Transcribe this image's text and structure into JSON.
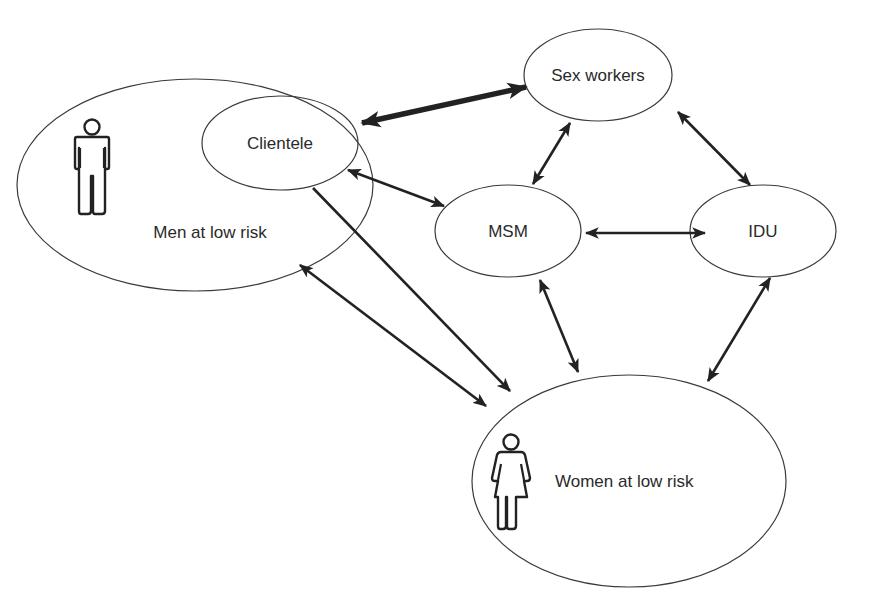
{
  "diagram": {
    "type": "network",
    "nodes": [
      {
        "id": "men",
        "label": "Men at low risk",
        "icon": "male-person-icon"
      },
      {
        "id": "clientele",
        "label": "Clientele",
        "parent": "men"
      },
      {
        "id": "sexworkers",
        "label": "Sex workers"
      },
      {
        "id": "msm",
        "label": "MSM"
      },
      {
        "id": "idu",
        "label": "IDU"
      },
      {
        "id": "women",
        "label": "Women at low risk",
        "icon": "female-person-icon"
      }
    ],
    "edges": [
      {
        "from": "clientele",
        "to": "sexworkers",
        "direction": "both",
        "weight": "thick"
      },
      {
        "from": "clientele",
        "to": "msm",
        "direction": "both",
        "weight": "normal"
      },
      {
        "from": "sexworkers",
        "to": "msm",
        "direction": "both",
        "weight": "normal"
      },
      {
        "from": "sexworkers",
        "to": "idu",
        "direction": "both",
        "weight": "normal"
      },
      {
        "from": "msm",
        "to": "idu",
        "direction": "both",
        "weight": "normal"
      },
      {
        "from": "msm",
        "to": "women",
        "direction": "both",
        "weight": "normal"
      },
      {
        "from": "idu",
        "to": "women",
        "direction": "both",
        "weight": "normal"
      },
      {
        "from": "clientele",
        "to": "women",
        "direction": "forward",
        "weight": "normal"
      },
      {
        "from": "men",
        "to": "women",
        "direction": "both",
        "weight": "normal"
      }
    ]
  },
  "labels": {
    "men": "Men at low risk",
    "clientele": "Clientele",
    "sexworkers": "Sex workers",
    "msm": "MSM",
    "idu": "IDU",
    "women": "Women at low risk"
  },
  "colors": {
    "stroke": "#222222",
    "background": "#ffffff"
  }
}
